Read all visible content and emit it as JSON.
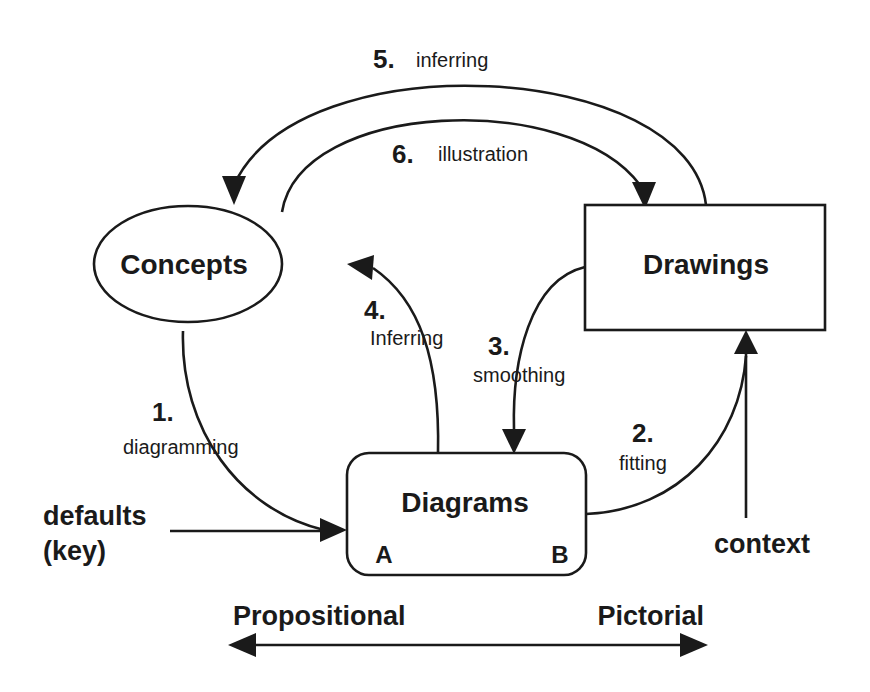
{
  "nodes": {
    "concepts": {
      "label": "Concepts",
      "shape": "ellipse"
    },
    "drawings": {
      "label": "Drawings",
      "shape": "rectangle"
    },
    "diagrams": {
      "label": "Diagrams",
      "shape": "rounded-rectangle",
      "corner_left": "A",
      "corner_right": "B"
    }
  },
  "edges": [
    {
      "id": 1,
      "number": "1.",
      "label": "diagramming",
      "from": "Concepts",
      "to": "Diagrams"
    },
    {
      "id": 2,
      "number": "2.",
      "label": "fitting",
      "from": "Diagrams",
      "to": "Drawings"
    },
    {
      "id": 3,
      "number": "3.",
      "label": "smoothing",
      "from": "Drawings",
      "to": "Diagrams"
    },
    {
      "id": 4,
      "number": "4.",
      "label": "Inferring",
      "from": "Diagrams",
      "to": "Concepts"
    },
    {
      "id": 5,
      "number": "5.",
      "label": "inferring",
      "from": "Drawings",
      "to": "Concepts"
    },
    {
      "id": 6,
      "number": "6.",
      "label": "illustration",
      "from": "Concepts",
      "to": "Drawings"
    }
  ],
  "inputs": {
    "defaults": {
      "line1": "defaults",
      "line2": "(key)",
      "target": "Diagrams"
    },
    "context": {
      "label": "context",
      "target": "Drawings"
    }
  },
  "axis": {
    "left": "Propositional",
    "right": "Pictorial",
    "direction": "bidirectional"
  },
  "colors": {
    "ink": "#1a1a1a",
    "background": "#ffffff"
  }
}
